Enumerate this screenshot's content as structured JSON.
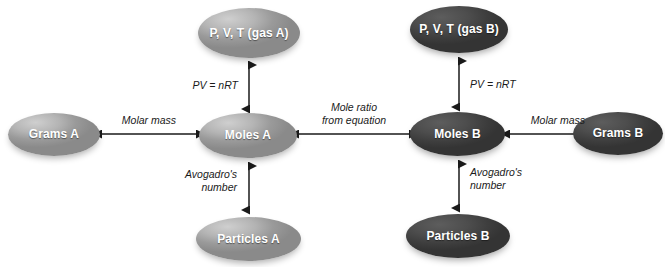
{
  "diagram": {
    "colors": {
      "node_light": "#b4b4b4",
      "node_dark": "#4d4d4d",
      "arrow": "#1a1a1a",
      "label_text": "#1a1a1a",
      "node_text": "#ffffff",
      "background": "#ffffff"
    },
    "nodes": [
      {
        "id": "gas_a",
        "label": "P, V, T\n(gas A)",
        "tone": "light"
      },
      {
        "id": "grams_a",
        "label": "Grams A",
        "tone": "light"
      },
      {
        "id": "moles_a",
        "label": "Moles A",
        "tone": "light"
      },
      {
        "id": "particles_a",
        "label": "Particles A",
        "tone": "light"
      },
      {
        "id": "gas_b",
        "label": "P, V, T\n(gas B)",
        "tone": "dark"
      },
      {
        "id": "moles_b",
        "label": "Moles B",
        "tone": "dark"
      },
      {
        "id": "grams_b",
        "label": "Grams B",
        "tone": "dark"
      },
      {
        "id": "particles_b",
        "label": "Particles B",
        "tone": "dark"
      }
    ],
    "connectors": [
      {
        "id": "gas_a_moles_a",
        "label": "PV = nRT",
        "from": "gas_a",
        "to": "moles_a",
        "orientation": "vertical",
        "double_headed": true
      },
      {
        "id": "grams_a_moles_a",
        "label": "Molar mass",
        "from": "grams_a",
        "to": "moles_a",
        "orientation": "horizontal",
        "double_headed": true
      },
      {
        "id": "moles_a_particles_a",
        "label": "Avogadro's\nnumber",
        "from": "moles_a",
        "to": "particles_a",
        "orientation": "vertical",
        "double_headed": true
      },
      {
        "id": "moles_a_moles_b",
        "label": "Mole ratio\nfrom equation",
        "from": "moles_a",
        "to": "moles_b",
        "orientation": "horizontal",
        "double_headed": true
      },
      {
        "id": "gas_b_moles_b",
        "label": "PV = nRT",
        "from": "gas_b",
        "to": "moles_b",
        "orientation": "vertical",
        "double_headed": true
      },
      {
        "id": "moles_b_grams_b",
        "label": "Molar mass",
        "from": "moles_b",
        "to": "grams_b",
        "orientation": "horizontal",
        "double_headed": true
      },
      {
        "id": "moles_b_particles_b",
        "label": "Avogadro's\nnumber",
        "from": "moles_b",
        "to": "particles_b",
        "orientation": "vertical",
        "double_headed": true
      }
    ]
  }
}
